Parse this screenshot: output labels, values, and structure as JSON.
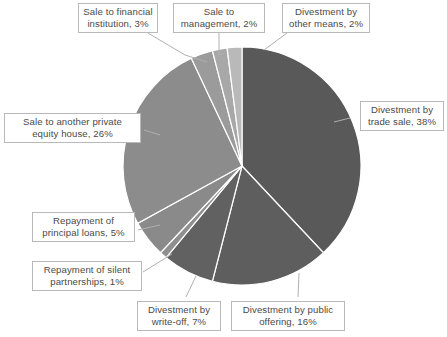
{
  "chart_data": {
    "type": "pie",
    "title": "",
    "subtitle": "",
    "xlabel": "",
    "ylabel": "",
    "legend_position": "none",
    "grid": false,
    "units": "percent",
    "start_angle_deg": 0,
    "direction": "clockwise",
    "center": {
      "x": 242,
      "y": 166
    },
    "radius": 119,
    "categories": [
      "Divestment by trade sale",
      "Divestment by public offering",
      "Divestment by write-off",
      "Repayment of silent partnerships",
      "Repayment of principal loans",
      "Sale to another private equity house",
      "Sale to financial institution",
      "Sale to management",
      "Divestment by other means"
    ],
    "values": [
      38,
      16,
      7,
      1,
      5,
      26,
      3,
      2,
      2
    ],
    "value_labels": [
      "38%",
      "16%",
      "7%",
      "1%",
      "5%",
      "26%",
      "3%",
      "2%",
      "2%"
    ],
    "colors": [
      "#595959",
      "#5e5e5e",
      "#616161",
      "#8f8f8f",
      "#8a8a8a",
      "#8c8c8c",
      "#9b9b9b",
      "#a8a8a8",
      "#b9b9b9"
    ],
    "slice_border_color": "#ffffff",
    "slices": [
      {
        "label": "Divestment by trade sale",
        "value": 38,
        "text": "Divestment by\ntrade sale, 38%"
      },
      {
        "label": "Divestment by public offering",
        "value": 16,
        "text": "Divestment by public\noffering, 16%"
      },
      {
        "label": "Divestment by write-off",
        "value": 7,
        "text": "Divestment by\nwrite-off, 7%"
      },
      {
        "label": "Repayment of silent partnerships",
        "value": 1,
        "text": "Repayment of silent\npartnerships, 1%"
      },
      {
        "label": "Repayment of principal loans",
        "value": 5,
        "text": "Repayment of\nprincipal loans, 5%"
      },
      {
        "label": "Sale to another private equity house",
        "value": 26,
        "text": "Sale to another private\nequity house, 26%"
      },
      {
        "label": "Sale to financial institution",
        "value": 3,
        "text": "Sale to financial\ninstitution, 3%"
      },
      {
        "label": "Sale to management",
        "value": 2,
        "text": "Sale to\nmanagement, 2%"
      },
      {
        "label": "Divestment by other means",
        "value": 2,
        "text": "Divestment by\nother means, 2%"
      }
    ]
  },
  "labels": {
    "financial_institution": "Sale to financial\ninstitution, 3%",
    "management": "Sale to\nmanagement, 2%",
    "other_means": "Divestment by\nother means, 2%",
    "trade_sale": "Divestment by\ntrade sale, 38%",
    "private_equity_house": "Sale to another private\nequity house, 26%",
    "principal_loans": "Repayment of\nprincipal loans, 5%",
    "silent_partnerships": "Repayment of silent\npartnerships, 1%",
    "write_off": "Divestment by\nwrite-off, 7%",
    "public_offering": "Divestment by public\noffering, 16%"
  },
  "style": {
    "leader_line_color": "#b0b0b0",
    "label_border_color": "#b9b9b9",
    "label_text_color": "#4a4a4a",
    "background": "#ffffff"
  }
}
